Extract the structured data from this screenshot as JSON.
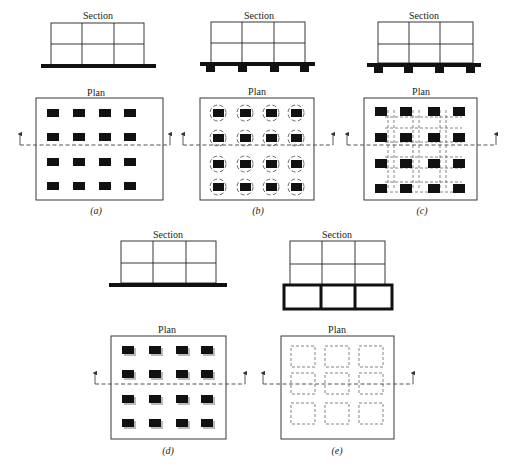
{
  "figure": {
    "panels": [
      {
        "id": "a",
        "label": "(a)",
        "section_title": "Section",
        "plan_title": "Plan",
        "type": "isolated spread footings"
      },
      {
        "id": "b",
        "label": "(b)",
        "section_title": "Section",
        "plan_title": "Plan",
        "type": "pile caps with piles"
      },
      {
        "id": "c",
        "label": "(c)",
        "section_title": "Section",
        "plan_title": "Plan",
        "type": "footings with grade beams"
      },
      {
        "id": "d",
        "label": "(d)",
        "section_title": "Section",
        "plan_title": "Plan",
        "type": "mat foundation"
      },
      {
        "id": "e",
        "label": "(e)",
        "section_title": "Section",
        "plan_title": "Plan",
        "type": "cellular raft"
      }
    ]
  },
  "colors": {
    "line": "#222222",
    "pad": "#111111",
    "shadow": "#bbbbbb",
    "dash": "#555555",
    "background": "#ffffff"
  }
}
